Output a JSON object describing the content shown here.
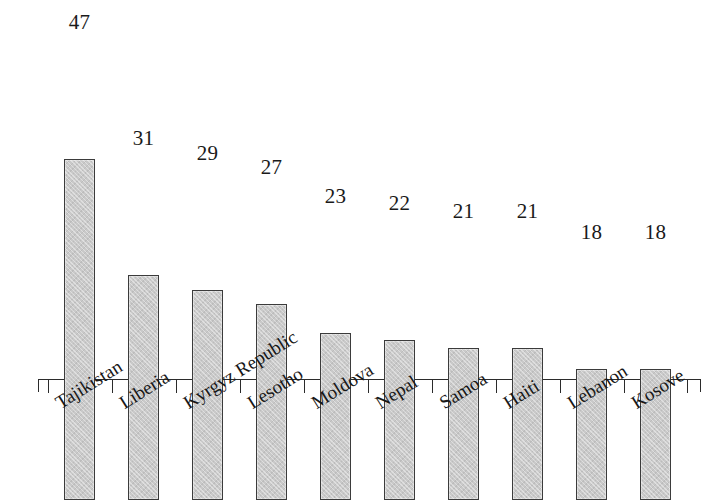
{
  "chart_data": {
    "type": "bar",
    "title": "",
    "subtitle": "",
    "xlabel": "",
    "ylabel": "",
    "categories": [
      "Tajikistan",
      "Liberia",
      "Kyrgyz Republic",
      "Lesotho",
      "Moldova",
      "Nepal",
      "Samoa",
      "Haiti",
      "Lebanon",
      "Kosove"
    ],
    "values": [
      47,
      31,
      29,
      27,
      23,
      22,
      21,
      21,
      18,
      18
    ],
    "data_labels": [
      "47",
      "31",
      "29",
      "27",
      "23",
      "22",
      "21",
      "21",
      "18",
      "18"
    ],
    "ylim": [
      0,
      47
    ],
    "grid": false,
    "legend": null,
    "y_axis_visible": false,
    "x_axis_visible": true,
    "tick_labels_rotated": true,
    "annotations": []
  },
  "style": {
    "background": "#ffffff",
    "bar_fill": "#c9c9c9",
    "bar_border": "#3b3b3b",
    "axis_color": "#2b2b2b",
    "text_color": "#1a1a1a"
  }
}
